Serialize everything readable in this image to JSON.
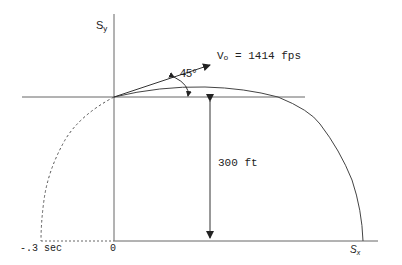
{
  "diagram": {
    "axes": {
      "y_label_main": "S",
      "y_label_sub": "y",
      "x_label_main": "S",
      "x_label_sub": "x",
      "origin_label": "0"
    },
    "velocity": {
      "label_main": "V",
      "label_sub": "o",
      "label_rest": " = 1414 fps",
      "angle_label": "45°"
    },
    "height": {
      "label": "300 ft"
    },
    "extrapolation": {
      "time_label": "-.3 sec"
    },
    "colors": {
      "stroke": "#333333",
      "axis": "#555555",
      "background": "#ffffff"
    }
  }
}
